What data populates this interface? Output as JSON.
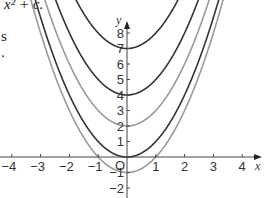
{
  "text": {
    "caption_fragment": "x² + c.",
    "side_fragment_1": "s",
    "side_fragment_2": "."
  },
  "chart_data": {
    "type": "line",
    "title": "",
    "xlabel": "x",
    "ylabel": "y",
    "origin_label": "O",
    "xlim": [
      -4.3,
      4.6
    ],
    "ylim": [
      -2.5,
      9
    ],
    "grid": false,
    "x_ticks": [
      -4,
      -3,
      -2,
      -1,
      1,
      2,
      3,
      4
    ],
    "y_ticks": [
      -2,
      -1,
      1,
      2,
      3,
      4,
      5,
      6,
      7,
      8
    ],
    "series": [
      {
        "name": "y = x² + 7",
        "c": 7,
        "vertex": [
          0,
          7
        ],
        "color": "#333333"
      },
      {
        "name": "y = x² + 4",
        "c": 4,
        "vertex": [
          0,
          4
        ],
        "color": "#333333"
      },
      {
        "name": "y = x² + 2",
        "c": 2,
        "vertex": [
          0,
          2
        ],
        "color": "#9a9a9a"
      },
      {
        "name": "y = x²",
        "c": 0,
        "vertex": [
          0,
          0
        ],
        "color": "#333333"
      },
      {
        "name": "y = x² − 1",
        "c": -1,
        "vertex": [
          0,
          -1
        ],
        "color": "#9a9a9a"
      }
    ]
  }
}
